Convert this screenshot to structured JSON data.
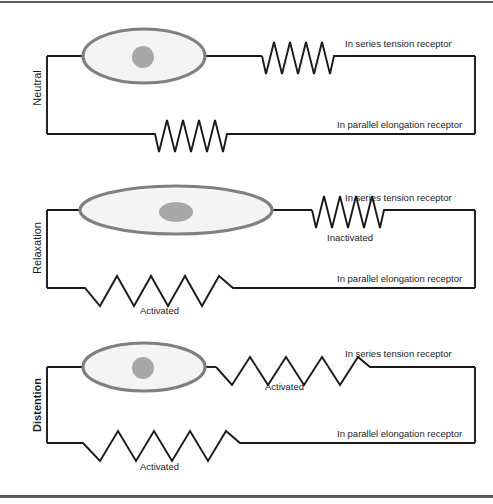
{
  "figure": {
    "width": 493,
    "height": 504,
    "colors": {
      "line": "#1a1a1a",
      "cell_outline": "#808080",
      "cell_fill": "#f4f4f4",
      "nucleus": "#a8a8a8",
      "frame_bar": "#5a5a5a",
      "text": "#1d1d1d"
    }
  },
  "panels": [
    {
      "id": "neutral",
      "state_label": "Neutral",
      "state_bold": false,
      "series_receptor_label": "In series tension receptor",
      "parallel_receptor_label": "In parallel elongation receptor",
      "series_spring_state": "",
      "parallel_spring_state": "",
      "series_spring_style": "compressed",
      "parallel_spring_style": "compressed",
      "cell_shape": "round-ellipse",
      "nucleus_shape": "circle"
    },
    {
      "id": "relaxation",
      "state_label": "Relaxation",
      "state_bold": false,
      "series_receptor_label": "In series tension receptor",
      "parallel_receptor_label": "In parallel elongation receptor",
      "series_spring_state": "Inactivated",
      "parallel_spring_state": "Activated",
      "series_spring_style": "compressed",
      "parallel_spring_style": "stretched",
      "cell_shape": "wide-flat-ellipse",
      "nucleus_shape": "wide-ellipse"
    },
    {
      "id": "distention",
      "state_label": "Distention",
      "state_bold": true,
      "series_receptor_label": "In series tension receptor",
      "parallel_receptor_label": "In parallel elongation receptor",
      "series_spring_state": "Activated",
      "parallel_spring_state": "Activated",
      "series_spring_style": "stretched",
      "parallel_spring_style": "stretched",
      "cell_shape": "round-ellipse",
      "nucleus_shape": "circle"
    }
  ]
}
